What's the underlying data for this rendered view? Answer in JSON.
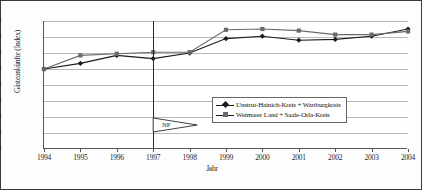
{
  "chart_data": {
    "type": "line",
    "title": "",
    "xlabel": "Jahr",
    "ylabel": "Gästeankünfte (Index)",
    "categories": [
      "1994",
      "1995",
      "1996",
      "1997",
      "1998",
      "1999",
      "2000",
      "2001",
      "2002",
      "2003",
      "2004"
    ],
    "xlim": [
      1994,
      2004
    ],
    "ylim": [
      0,
      160
    ],
    "yticks": [
      0,
      20,
      40,
      60,
      80,
      100,
      120,
      140,
      160
    ],
    "grid": true,
    "legend_position": "inside-lower-right",
    "series": [
      {
        "name": "Unstrut-Hainich-Kreis + Wartburgkreis",
        "marker": "diamond",
        "color": "#1a1a1a",
        "values": [
          100,
          107,
          117,
          113,
          120,
          138,
          141,
          136,
          137,
          141,
          150
        ]
      },
      {
        "name": "Weimarer Land + Saale-Orla-Kreis",
        "marker": "square",
        "color": "#6a6a6a",
        "values": [
          100,
          117,
          119,
          121,
          121,
          149,
          150,
          148,
          143,
          143,
          147
        ]
      }
    ],
    "annotations": [
      {
        "label": "NP",
        "at_year": 1997,
        "shape": "pennant"
      }
    ]
  },
  "axis": {
    "y_tick_labels": [
      "0",
      "20",
      "40",
      "60",
      "80",
      "100",
      "120",
      "140",
      "160"
    ],
    "x_tick_labels": [
      "1994",
      "1995",
      "1996",
      "1997",
      "1998",
      "1999",
      "2000",
      "2001",
      "2002",
      "2003",
      "2004"
    ],
    "y_title": "Gästeankünfte (Index)",
    "x_title": "Jahr"
  },
  "legend": {
    "items": [
      {
        "label": "Unstrut-Hainich-Kreis + Wartburgkreis"
      },
      {
        "label": "Weimarer Land + Saale-Orla-Kreis"
      }
    ]
  },
  "annotation": {
    "np_label": "NP"
  }
}
